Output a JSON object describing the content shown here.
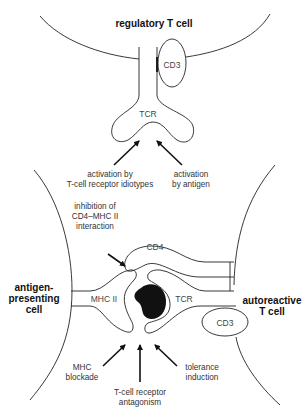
{
  "diagram": {
    "cells": {
      "regulatory": "regulatory T cell",
      "apc_line1": "antigen-",
      "apc_line2": "presenting",
      "apc_line3": "cell",
      "autoreactive_line1": "autoreactive",
      "autoreactive_line2": "T cell"
    },
    "molecules": {
      "cd3_top": "CD3",
      "tcr_top": "TCR",
      "cd4": "CD4",
      "mhc2": "MHC II",
      "tcr_bottom": "TCR",
      "cd3_bottom": "CD3"
    },
    "annotations": {
      "idiotype_line1": "activation by",
      "idiotype_line2": "T-cell receptor idiotypes",
      "antigen_line1": "activation",
      "antigen_line2": "by antigen",
      "cd4_line1": "inhibition of",
      "cd4_line2": "CD4–MHC II",
      "cd4_line3": "interaction",
      "mhc_block_line1": "MHC",
      "mhc_block_line2": "blockade",
      "antagonism_line1": "T-cell receptor",
      "antagonism_line2": "antagonism",
      "tolerance_line1": "tolerance",
      "tolerance_line2": "induction"
    }
  }
}
